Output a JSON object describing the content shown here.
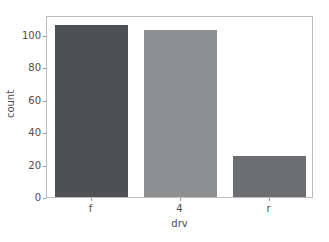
{
  "chart_data": {
    "type": "bar",
    "title": "",
    "subtitle": "",
    "xlabel": "drv",
    "ylabel": "count",
    "categories": [
      "f",
      "4",
      "r"
    ],
    "values": [
      106,
      103,
      25
    ],
    "ylim": [
      0,
      112
    ],
    "xlim": [
      0,
      3
    ],
    "yticks": [
      0,
      20,
      40,
      60,
      80,
      100
    ],
    "ytick_labels": [
      "0",
      "20",
      "40",
      "60",
      "80",
      "100"
    ],
    "xtick_labels": [
      "f",
      "4",
      "r"
    ],
    "grid": false,
    "legend": null,
    "legend_position": "none",
    "bar_colors": [
      "#4f5053",
      "#8e8f91",
      "#6d6e71"
    ],
    "frame_color": "#bcbcbe",
    "background_color": "#ffffff",
    "tick_color": "#9a9a9c",
    "text_color": "#4d4d4d",
    "annotations": []
  }
}
